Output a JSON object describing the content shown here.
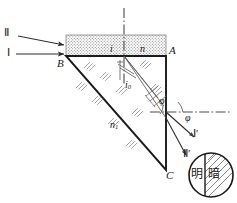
{
  "figure": {
    "colors": {
      "ink": "#1a1a1a",
      "thin": "#6b6b6b",
      "hatch": "#8a8a8a",
      "stipple": "#9a9a9a",
      "background": "#ffffff"
    }
  },
  "vertices": {
    "B": "B",
    "A": "A",
    "C": "C"
  },
  "incident_rays": {
    "ray_upper": "Ⅱ",
    "ray_lower": "Ⅰ"
  },
  "exit_rays": {
    "ray_upper": "Ⅰ′",
    "ray_lower": "Ⅱ′"
  },
  "angles": {
    "incidence": "i",
    "internal": "i",
    "internal_sub": "0",
    "exit": "φ",
    "exit_inner": "φ"
  },
  "media": {
    "film_index": "n",
    "prism_index": "n",
    "prism_index_sub": "1"
  },
  "detail_circle": {
    "bright": "明",
    "dark": "暗"
  }
}
